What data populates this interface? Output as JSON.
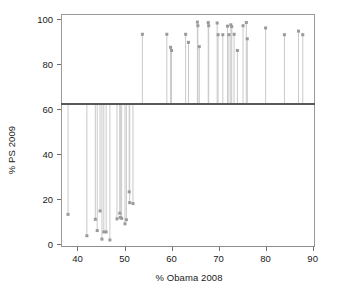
{
  "chart_data": {
    "type": "scatter",
    "title": "",
    "subtitle": "",
    "xlabel": "% Obama 2008",
    "ylabel": "% PS 2009",
    "xlim": [
      36.5,
      90.5
    ],
    "ylim": [
      -1.5,
      102
    ],
    "xticks": [
      40,
      50,
      60,
      70,
      80,
      90
    ],
    "yticks": [
      0,
      20,
      40,
      60,
      80,
      100
    ],
    "grid": false,
    "legend": null,
    "reference_line": {
      "orientation": "horizontal",
      "value": 62,
      "color": "#595959",
      "width": 2
    },
    "marker": {
      "shape": "square",
      "color": "#9a9a9a",
      "size": 3
    },
    "stem": {
      "color": "#c9c9c9",
      "width": 1,
      "baseline": 62
    },
    "series": [
      {
        "name": "constituencies",
        "points": [
          {
            "x": 38.0,
            "y": 13.0
          },
          {
            "x": 42.0,
            "y": 3.5
          },
          {
            "x": 43.8,
            "y": 10.8
          },
          {
            "x": 44.2,
            "y": 5.8
          },
          {
            "x": 44.8,
            "y": 14.5
          },
          {
            "x": 45.2,
            "y": 2.0
          },
          {
            "x": 45.6,
            "y": 5.2
          },
          {
            "x": 46.1,
            "y": 5.2
          },
          {
            "x": 46.9,
            "y": 1.6
          },
          {
            "x": 48.4,
            "y": 11.0
          },
          {
            "x": 49.0,
            "y": 13.5
          },
          {
            "x": 49.1,
            "y": 11.6
          },
          {
            "x": 49.4,
            "y": 11.2
          },
          {
            "x": 50.1,
            "y": 8.8
          },
          {
            "x": 50.4,
            "y": 10.6
          },
          {
            "x": 51.0,
            "y": 23.0
          },
          {
            "x": 51.1,
            "y": 18.2
          },
          {
            "x": 51.8,
            "y": 17.8
          },
          {
            "x": 53.8,
            "y": 93.0
          },
          {
            "x": 59.0,
            "y": 93.0
          },
          {
            "x": 59.8,
            "y": 87.2
          },
          {
            "x": 60.0,
            "y": 85.8
          },
          {
            "x": 63.0,
            "y": 93.0
          },
          {
            "x": 63.6,
            "y": 89.4
          },
          {
            "x": 65.5,
            "y": 98.4
          },
          {
            "x": 65.6,
            "y": 96.8
          },
          {
            "x": 65.9,
            "y": 87.5
          },
          {
            "x": 67.8,
            "y": 98.2
          },
          {
            "x": 67.9,
            "y": 96.8
          },
          {
            "x": 69.7,
            "y": 98.0
          },
          {
            "x": 69.9,
            "y": 92.8
          },
          {
            "x": 70.9,
            "y": 92.8
          },
          {
            "x": 71.9,
            "y": 96.6
          },
          {
            "x": 72.2,
            "y": 92.8
          },
          {
            "x": 72.6,
            "y": 97.2
          },
          {
            "x": 72.8,
            "y": 96.4
          },
          {
            "x": 73.3,
            "y": 93.0
          },
          {
            "x": 74.0,
            "y": 85.8
          },
          {
            "x": 75.2,
            "y": 96.8
          },
          {
            "x": 75.9,
            "y": 98.2
          },
          {
            "x": 76.1,
            "y": 91.0
          },
          {
            "x": 80.0,
            "y": 95.8
          },
          {
            "x": 84.0,
            "y": 92.8
          },
          {
            "x": 87.0,
            "y": 94.4
          },
          {
            "x": 87.9,
            "y": 92.8
          }
        ]
      }
    ]
  }
}
